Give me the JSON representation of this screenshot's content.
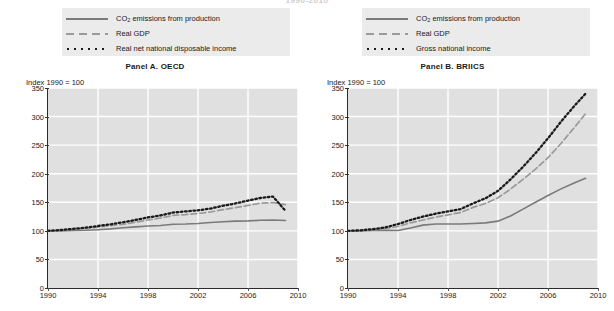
{
  "figure": {
    "suptitle": "1990-2010"
  },
  "panels": [
    {
      "id": "panel-a",
      "title": "Panel A. OECD",
      "axis_note": "Index 1990 = 100",
      "legend": [
        {
          "label_html": "CO<sub>2</sub> emissions from production",
          "label": "CO2 emissions from production",
          "style": "solid",
          "color": "#7a7a7a"
        },
        {
          "label_html": "Real GDP",
          "label": "Real GDP",
          "style": "dashed",
          "color": "#9a9a9a"
        },
        {
          "label_html": "Real net national disposable income",
          "label": "Real net national disposable income",
          "style": "dotted",
          "color": "#1a1a1a"
        }
      ]
    },
    {
      "id": "panel-b",
      "title": "Panel B. BRIICS",
      "axis_note": "Index 1990 = 100",
      "legend": [
        {
          "label_html": "CO<sub>2</sub> emissions from production",
          "label": "CO2 emissions from production",
          "style": "solid",
          "color": "#7a7a7a"
        },
        {
          "label_html": "Real GDP",
          "label": "Real GDP",
          "style": "dashed",
          "color": "#9a9a9a"
        },
        {
          "label_html": "Gross national income",
          "label": "Gross national income",
          "style": "dotted",
          "color": "#1a1a1a"
        }
      ]
    }
  ],
  "chart_data": [
    {
      "type": "line",
      "title": "Panel A. OECD",
      "subtitle": "1990-2010",
      "xlabel": "",
      "ylabel": "Index 1990 = 100",
      "xlim": [
        1990,
        2010
      ],
      "ylim": [
        0,
        350
      ],
      "yticks": [
        0,
        50,
        100,
        150,
        200,
        250,
        300,
        350
      ],
      "xticks": [
        1990,
        1994,
        1998,
        2002,
        2006,
        2010
      ],
      "grid": true,
      "legend_position": "above",
      "x": [
        1990,
        1991,
        1992,
        1993,
        1994,
        1995,
        1996,
        1997,
        1998,
        1999,
        2000,
        2001,
        2002,
        2003,
        2004,
        2005,
        2006,
        2007,
        2008,
        2009
      ],
      "series": [
        {
          "name": "CO2 emissions from production",
          "style": "solid",
          "color": "#7a7a7a",
          "values": [
            100,
            100,
            100.5,
            101,
            102,
            103.5,
            105.5,
            107,
            108.5,
            109.5,
            111.5,
            112,
            113,
            114.5,
            116,
            117,
            117.5,
            118.5,
            119,
            118
          ]
        },
        {
          "name": "Real GDP",
          "style": "dashed",
          "color": "#9a9a9a",
          "values": [
            100,
            101,
            102.5,
            104,
            106.5,
            109,
            111.5,
            115,
            119,
            122.5,
            127,
            128.5,
            130.5,
            133,
            137,
            140.5,
            144.5,
            148.5,
            149.5,
            146
          ]
        },
        {
          "name": "Real net national disposable income",
          "style": "dotted",
          "color": "#1a1a1a",
          "values": [
            100,
            101.5,
            103.5,
            105.5,
            108.5,
            111.5,
            115,
            119,
            123.5,
            127,
            132,
            134,
            136,
            139,
            144,
            148,
            153,
            157.5,
            160,
            135
          ]
        }
      ]
    },
    {
      "type": "line",
      "title": "Panel B. BRIICS",
      "subtitle": "1990-2010",
      "xlabel": "",
      "ylabel": "Index 1990 = 100",
      "xlim": [
        1990,
        2010
      ],
      "ylim": [
        0,
        350
      ],
      "yticks": [
        0,
        50,
        100,
        150,
        200,
        250,
        300,
        350
      ],
      "xticks": [
        1990,
        1994,
        1998,
        2002,
        2006,
        2010
      ],
      "grid": true,
      "legend_position": "above",
      "x": [
        1990,
        1991,
        1992,
        1993,
        1994,
        1995,
        1996,
        1997,
        1998,
        1999,
        2000,
        2001,
        2002,
        2003,
        2004,
        2005,
        2006,
        2007,
        2008,
        2009
      ],
      "series": [
        {
          "name": "CO2 emissions from production",
          "style": "solid",
          "color": "#7a7a7a",
          "values": [
            100,
            100,
            100.5,
            101,
            100.5,
            105,
            110,
            112,
            112,
            112,
            113,
            114,
            117,
            126,
            138,
            150,
            162,
            173,
            183,
            192
          ]
        },
        {
          "name": "Real GDP",
          "style": "dashed",
          "color": "#9a9a9a",
          "values": [
            100,
            100.5,
            102,
            104,
            108,
            114,
            119,
            124,
            128,
            132,
            141,
            148,
            158,
            173,
            190,
            208,
            228,
            252,
            278,
            305
          ]
        },
        {
          "name": "Gross national income",
          "style": "dotted",
          "color": "#1a1a1a",
          "values": [
            100,
            101,
            103,
            106,
            112,
            119,
            125,
            130,
            134,
            138,
            148,
            157,
            170,
            190,
            212,
            236,
            262,
            290,
            316,
            340
          ]
        }
      ]
    }
  ]
}
